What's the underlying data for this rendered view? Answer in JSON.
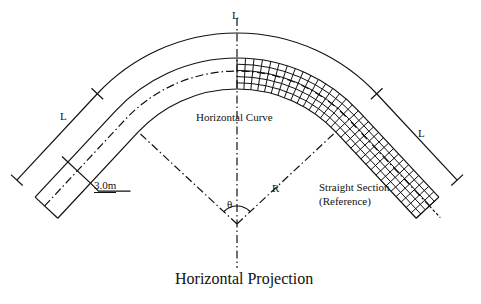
{
  "diagram": {
    "title": "Horizontal Projection",
    "labels": {
      "top_length": "L",
      "left_length": "L",
      "right_length": "L",
      "curve": "Horizontal Curve",
      "radius": "R",
      "angle": "θ",
      "width": "3.0m",
      "straight_line1": "Straight Section",
      "straight_line2": "(Reference)"
    },
    "geometry": {
      "center": [
        237,
        224
      ],
      "outer_dimension_radius": 191,
      "road_outer_radius": 166,
      "centerline_radius": 153,
      "road_inner_radius": 135,
      "half_angle_deg": 47
    },
    "colors": {
      "line": "#111111",
      "background": "#ffffff"
    }
  }
}
